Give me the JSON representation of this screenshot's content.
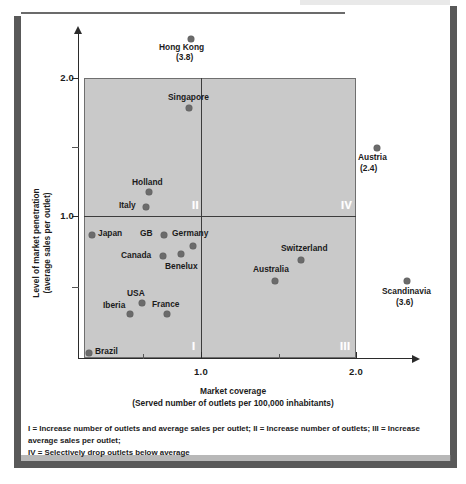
{
  "figure": {
    "ylabel_line1": "Level of market penetration",
    "ylabel_line2": "(average sales per outlet)",
    "xlabel_line1": "Market coverage",
    "xlabel_line2": "(Served number of outlets per 100,000 inhabitants)",
    "footnote_line1": "I = Increase number of outlets and average sales per outlet; II = Increase number of outlets; III = Increase average sales per outlet;",
    "footnote_line2": "IV = Selectively drop outlets below average"
  },
  "chart_data": {
    "type": "scatter",
    "title": "",
    "xlabel": "Market coverage (Served number of outlets per 100,000 inhabitants)",
    "ylabel": "Level of market penetration (average sales per outlet)",
    "xlim": [
      0,
      2.4
    ],
    "ylim": [
      0,
      2.2
    ],
    "xticks": [
      "1.0",
      "2.0"
    ],
    "yticks": [
      "1.0",
      "2.0"
    ],
    "grid": false,
    "legend": "none",
    "quadrant_divider_x": 1.0,
    "quadrant_divider_y": 1.0,
    "quadrants": [
      {
        "id": "I",
        "label": "I",
        "meaning": "Increase number of outlets and average sales per outlet"
      },
      {
        "id": "II",
        "label": "II",
        "meaning": "Increase number of outlets"
      },
      {
        "id": "III",
        "label": "III",
        "meaning": "Increase average sales per outlet"
      },
      {
        "id": "IV",
        "label": "IV",
        "meaning": "Selectively drop outlets below average"
      }
    ],
    "points": [
      {
        "name": "Hong Kong",
        "x": 1.02,
        "y": 3.8,
        "value_note": "(3.8)",
        "off_chart": true
      },
      {
        "name": "Singapore",
        "x": 1.0,
        "y": 1.85,
        "value_note": "",
        "off_chart": false
      },
      {
        "name": "Austria",
        "x": 2.35,
        "y": 1.53,
        "value_note": "(2.4)",
        "off_chart": true
      },
      {
        "name": "Holland",
        "x": 0.92,
        "y": 1.18,
        "value_note": "",
        "off_chart": false
      },
      {
        "name": "Italy",
        "x": 0.86,
        "y": 1.04,
        "value_note": "",
        "off_chart": false
      },
      {
        "name": "Japan",
        "x": 0.07,
        "y": 0.92,
        "value_note": "",
        "off_chart": false
      },
      {
        "name": "GB",
        "x": 0.76,
        "y": 0.92,
        "value_note": "",
        "off_chart": false
      },
      {
        "name": "Germany",
        "x": 0.94,
        "y": 0.86,
        "value_note": "",
        "off_chart": false
      },
      {
        "name": "Canada",
        "x": 0.77,
        "y": 0.8,
        "value_note": "",
        "off_chart": false
      },
      {
        "name": "Benelux",
        "x": 0.87,
        "y": 0.82,
        "value_note": "",
        "off_chart": false
      },
      {
        "name": "Switzerland",
        "x": 1.62,
        "y": 0.85,
        "value_note": "",
        "off_chart": false
      },
      {
        "name": "Australia",
        "x": 1.39,
        "y": 0.73,
        "value_note": "",
        "off_chart": false
      },
      {
        "name": "Scandinavia",
        "x": 2.45,
        "y": 0.7,
        "value_note": "(3.6)",
        "off_chart": true
      },
      {
        "name": "USA",
        "x": 0.7,
        "y": 0.56,
        "value_note": "",
        "off_chart": false
      },
      {
        "name": "Iberia",
        "x": 0.62,
        "y": 0.48,
        "value_note": "",
        "off_chart": false
      },
      {
        "name": "France",
        "x": 0.83,
        "y": 0.48,
        "value_note": "",
        "off_chart": false
      },
      {
        "name": "Brazil",
        "x": 0.05,
        "y": 0.1,
        "value_note": "",
        "off_chart": false
      }
    ]
  },
  "points_layout": [
    {
      "name": "Hong Kong",
      "dot_x": 188,
      "dot_y": 36,
      "label": "Hong Kong",
      "label_x": 159,
      "label_y": 42,
      "note": "(3.8)",
      "note_x": 176,
      "note_y": 52
    },
    {
      "name": "Singapore",
      "dot_x": 186,
      "dot_y": 105,
      "label": "Singapore",
      "label_x": 168,
      "label_y": 92,
      "note": "",
      "note_x": 0,
      "note_y": 0
    },
    {
      "name": "Austria",
      "dot_x": 374,
      "dot_y": 145,
      "label": "Austria",
      "label_x": 358,
      "label_y": 152,
      "note": "(2.4)",
      "note_x": 360,
      "note_y": 163
    },
    {
      "name": "Holland",
      "dot_x": 146,
      "dot_y": 189,
      "label": "Holland",
      "label_x": 132,
      "label_y": 177,
      "note": "",
      "note_x": 0,
      "note_y": 0
    },
    {
      "name": "Italy",
      "dot_x": 143,
      "dot_y": 204,
      "label": "Italy",
      "label_x": 119,
      "label_y": 200,
      "note": "",
      "note_x": 0,
      "note_y": 0
    },
    {
      "name": "Japan",
      "dot_x": 89,
      "dot_y": 232,
      "label": "Japan",
      "label_x": 98,
      "label_y": 228,
      "note": "",
      "note_x": 0,
      "note_y": 0
    },
    {
      "name": "GB",
      "dot_x": 161,
      "dot_y": 232,
      "label": "GB",
      "label_x": 140,
      "label_y": 228,
      "note": "",
      "note_x": 0,
      "note_y": 0
    },
    {
      "name": "Germany",
      "dot_x": 190,
      "dot_y": 243,
      "label": "Germany",
      "label_x": 172,
      "label_y": 228,
      "note": "",
      "note_x": 0,
      "note_y": 0
    },
    {
      "name": "Canada",
      "dot_x": 160,
      "dot_y": 253,
      "label": "Canada",
      "label_x": 121,
      "label_y": 250,
      "note": "",
      "note_x": 0,
      "note_y": 0
    },
    {
      "name": "Benelux",
      "dot_x": 178,
      "dot_y": 251,
      "label": "Benelux",
      "label_x": 165,
      "label_y": 261,
      "note": "",
      "note_x": 0,
      "note_y": 0
    },
    {
      "name": "Switzerland",
      "dot_x": 298,
      "dot_y": 257,
      "label": "Switzerland",
      "label_x": 281,
      "label_y": 243,
      "note": "",
      "note_x": 0,
      "note_y": 0
    },
    {
      "name": "Australia",
      "dot_x": 272,
      "dot_y": 278,
      "label": "Australia",
      "label_x": 253,
      "label_y": 264,
      "note": "",
      "note_x": 0,
      "note_y": 0
    },
    {
      "name": "Scandinavia",
      "dot_x": 404,
      "dot_y": 278,
      "label": "Scandinavia",
      "label_x": 382,
      "label_y": 286,
      "note": "(3.6)",
      "note_x": 396,
      "note_y": 297
    },
    {
      "name": "USA",
      "dot_x": 139,
      "dot_y": 300,
      "label": "USA",
      "label_x": 127,
      "label_y": 288,
      "note": "",
      "note_x": 0,
      "note_y": 0
    },
    {
      "name": "Iberia",
      "dot_x": 127,
      "dot_y": 311,
      "label": "Iberia",
      "label_x": 103,
      "label_y": 300,
      "note": "",
      "note_x": 0,
      "note_y": 0
    },
    {
      "name": "France",
      "dot_x": 164,
      "dot_y": 311,
      "label": "France",
      "label_x": 152,
      "label_y": 299,
      "note": "",
      "note_x": 0,
      "note_y": 0
    },
    {
      "name": "Brazil",
      "dot_x": 86,
      "dot_y": 350,
      "label": "Brazil",
      "label_x": 95,
      "label_y": 346,
      "note": "",
      "note_x": 0,
      "note_y": 0
    }
  ],
  "axis_layout": {
    "y_ticks": [
      {
        "label": "2.0",
        "y": 78,
        "major": true
      },
      {
        "label": "",
        "y": 147,
        "major": false
      },
      {
        "label": "1.0",
        "y": 216,
        "major": true
      },
      {
        "label": "",
        "y": 287,
        "major": false
      }
    ],
    "x_ticks": [
      {
        "label": "",
        "x": 143,
        "major": false
      },
      {
        "label": "1.0",
        "x": 201,
        "major": true
      },
      {
        "label": "",
        "x": 279,
        "major": false
      },
      {
        "label": "2.0",
        "x": 356,
        "major": true
      }
    ],
    "quadrants": [
      {
        "label": "I",
        "x": 192,
        "y": 340
      },
      {
        "label": "II",
        "x": 192,
        "y": 199
      },
      {
        "label": "III",
        "x": 340,
        "y": 340
      },
      {
        "label": "IV",
        "x": 341,
        "y": 199
      }
    ]
  }
}
